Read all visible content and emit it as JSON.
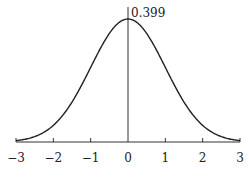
{
  "chart_data": {
    "type": "line",
    "title": "",
    "xlabel": "",
    "ylabel": "",
    "series": [
      {
        "name": "standard normal density",
        "function": "exp(-x^2/2)/sqrt(2*pi)",
        "x": [
          -3,
          -2.5,
          -2,
          -1.5,
          -1,
          -0.5,
          0,
          0.5,
          1,
          1.5,
          2,
          2.5,
          3
        ],
        "values": [
          0.004,
          0.018,
          0.054,
          0.13,
          0.242,
          0.352,
          0.399,
          0.352,
          0.242,
          0.13,
          0.054,
          0.018,
          0.004
        ]
      }
    ],
    "xlim": [
      -3,
      3
    ],
    "ylim": [
      0,
      0.399
    ],
    "x_ticks": [
      -3,
      -2,
      -1,
      0,
      1,
      2,
      3
    ],
    "x_tick_labels": [
      "−3",
      "−2",
      "−1",
      "0",
      "1",
      "2",
      "3"
    ],
    "annotations": [
      {
        "text": "0.399",
        "x": 0,
        "y": 0.399
      }
    ],
    "grid": false,
    "legend": "none"
  },
  "labels": {
    "peak": "0.399",
    "ticks": [
      "−3",
      "−2",
      "−1",
      "0",
      "1",
      "2",
      "3"
    ]
  }
}
